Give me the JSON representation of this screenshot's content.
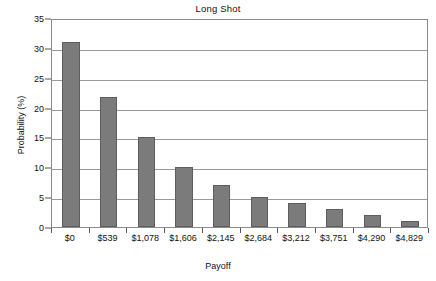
{
  "chart_data": {
    "type": "bar",
    "title": "Long Shot",
    "xlabel": "Payoff",
    "ylabel": "Probability (%)",
    "categories": [
      "$0",
      "$539",
      "$1,078",
      "$1,606",
      "$2,145",
      "$2,684",
      "$3,212",
      "$3,751",
      "$4,290",
      "$4,829"
    ],
    "values": [
      31,
      21.8,
      15,
      10,
      7,
      5,
      4,
      3,
      2,
      1
    ],
    "ylim": [
      0,
      35
    ],
    "yticks": [
      0,
      5,
      10,
      15,
      20,
      25,
      30,
      35
    ],
    "ytick_labels": [
      "0",
      "5",
      "10",
      "15",
      "20",
      "25",
      "30",
      "35"
    ],
    "grid": "horizontal",
    "legend": "none",
    "bar_color": "#7b7b7b",
    "bar_edge_color": "#5d5d5d",
    "axis_color": "#8a8a8a",
    "grid_color": "#9a9a9a",
    "background": "#ffffff"
  }
}
